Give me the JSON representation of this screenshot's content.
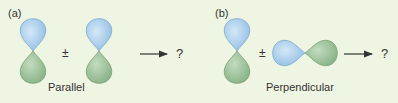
{
  "panels": [
    {
      "label": "(a)",
      "operator": "±",
      "result": "?",
      "caption": "Parallel",
      "orbitals": [
        {
          "orientation": "vertical",
          "top_phase": "blue",
          "bottom_phase": "green"
        },
        {
          "orientation": "vertical",
          "top_phase": "blue",
          "bottom_phase": "green"
        }
      ]
    },
    {
      "label": "(b)",
      "operator": "±",
      "result": "?",
      "caption": "Perpendicular",
      "orbitals": [
        {
          "orientation": "vertical",
          "top_phase": "blue",
          "bottom_phase": "green"
        },
        {
          "orientation": "horizontal",
          "left_phase": "blue",
          "right_phase": "green"
        }
      ]
    }
  ],
  "colors": {
    "background": "#eef5e3",
    "blue_lobe": "#a9cdec",
    "green_lobe": "#9cc29a",
    "text": "#333333",
    "arrow": "#333333"
  }
}
